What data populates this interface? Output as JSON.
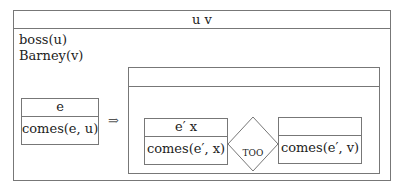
{
  "outer_box": {
    "header": "u v",
    "conditions": [
      "boss(u)",
      "Barney(v)"
    ]
  },
  "antecedent_box": {
    "header": "e",
    "conditions": [
      "comes(e, u)"
    ]
  },
  "implication_symbol": "⇒",
  "consequent_box": {
    "header": "",
    "left_box": {
      "header": "e′ x",
      "conditions": [
        "comes(e′, x)"
      ]
    },
    "relation": "TOO",
    "right_box": {
      "header": "",
      "conditions": [
        "comes(e′, v)"
      ]
    }
  }
}
